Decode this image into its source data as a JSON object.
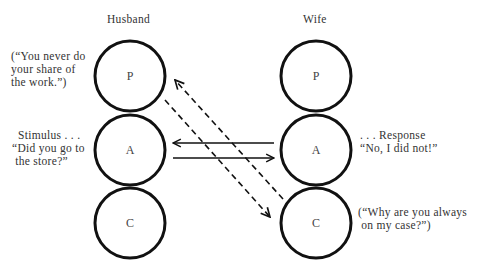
{
  "husband": {
    "title": "Husband",
    "states": [
      "P",
      "A",
      "C"
    ],
    "parent_quote": "(“You never do\nyour share of\nthe work.”)",
    "stimulus_label": "Stimulus . . .",
    "stimulus_quote": "“Did you go to\n the store?”"
  },
  "wife": {
    "title": "Wife",
    "states": [
      "P",
      "A",
      "C"
    ],
    "response_label": ". . . Response",
    "response_quote": "“No, I did not!”",
    "child_quote": "(“Why are you always\n on my case?”)"
  },
  "transactions": [
    {
      "from": "husband.A",
      "to": "wife.A",
      "style": "solid"
    },
    {
      "from": "wife.A",
      "to": "husband.A",
      "style": "solid"
    },
    {
      "from": "husband.P",
      "to": "wife.C",
      "style": "dashed"
    },
    {
      "from": "wife.C",
      "to": "husband.P",
      "style": "dashed"
    }
  ]
}
